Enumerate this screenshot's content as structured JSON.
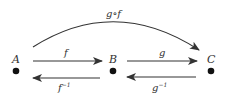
{
  "diagram": {
    "nodes": [
      {
        "id": "A",
        "label": "A",
        "x": 16,
        "y": 71
      },
      {
        "id": "B",
        "label": "B",
        "x": 113,
        "y": 71
      },
      {
        "id": "C",
        "label": "C",
        "x": 211,
        "y": 71
      }
    ],
    "edges": [
      {
        "from": "A",
        "to": "B",
        "label": "f"
      },
      {
        "from": "B",
        "to": "A",
        "label": "f",
        "superscript": "−1"
      },
      {
        "from": "B",
        "to": "C",
        "label": "g"
      },
      {
        "from": "C",
        "to": "B",
        "label": "g",
        "superscript": "−1"
      },
      {
        "from": "A",
        "to": "C",
        "label": "g∘f",
        "curved": true
      }
    ],
    "colors": {
      "line": "#333333",
      "node": "#111111",
      "text": "#333333"
    }
  }
}
